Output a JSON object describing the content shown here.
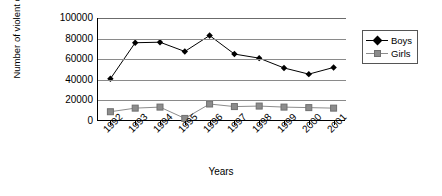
{
  "chart_data": {
    "type": "line",
    "title": "",
    "xlabel": "Years",
    "ylabel": "Number of violent crimes",
    "categories": [
      "1992",
      "1993",
      "1994",
      "1995",
      "1996",
      "1997",
      "1998",
      "1999",
      "2000",
      "2001"
    ],
    "series": [
      {
        "name": "Boys",
        "marker": "diamond",
        "color": "#000000",
        "values": [
          41000,
          76000,
          76500,
          67500,
          83000,
          65000,
          61000,
          51500,
          45500,
          52000
        ]
      },
      {
        "name": "Girls",
        "marker": "square",
        "color": "#8c8c8c",
        "values": [
          9000,
          12500,
          13500,
          2500,
          16500,
          14000,
          14500,
          13500,
          13000,
          12500
        ]
      }
    ],
    "ylim": [
      0,
      100000
    ],
    "ytick_labels": [
      "100000",
      "80000",
      "60000",
      "40000",
      "20000",
      "0"
    ],
    "ytick_values": [
      100000,
      80000,
      60000,
      40000,
      20000,
      0
    ],
    "grid": true,
    "legend_position": "right",
    "legend_entries": [
      "Boys",
      "Girls"
    ]
  }
}
